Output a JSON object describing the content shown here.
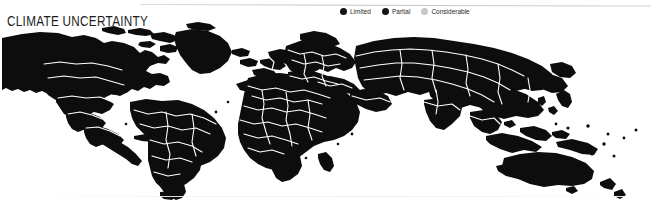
{
  "map": {
    "title": "CLIMATE UNCERTAINTY",
    "style": "world-silhouette-choropleth",
    "background_color": "#ffffff",
    "land_color": "#0d0d0d",
    "border_color": "#ffffff",
    "legend": {
      "items": [
        {
          "label": "Limited",
          "color": "#141414",
          "icon": "filled-circle-icon"
        },
        {
          "label": "Partial",
          "color": "#141414",
          "icon": "filled-circle-icon"
        },
        {
          "label": "Considerable",
          "color": "#c8c8c8",
          "icon": "filled-circle-icon"
        }
      ]
    }
  }
}
